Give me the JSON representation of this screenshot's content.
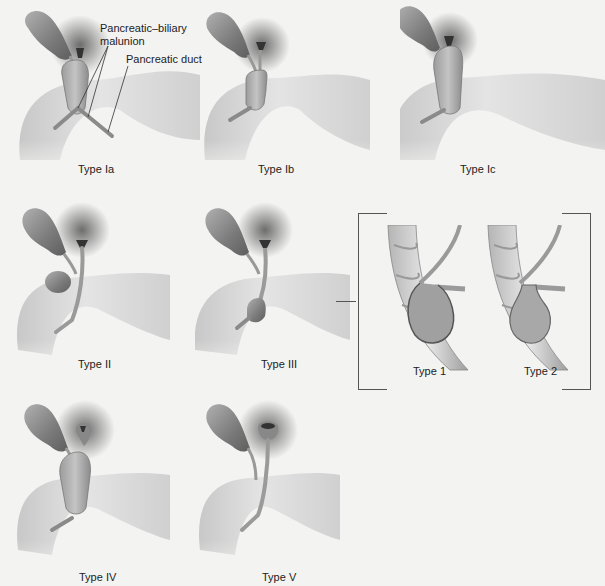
{
  "figure": {
    "background": "#f3f3f2",
    "colors": {
      "gallbladder": "#8a8a8a",
      "duct": "#9a9a9a",
      "duodenum": "#d9d9d9",
      "shadow": "#3a3a3a"
    }
  },
  "annotations": {
    "malunion": "Pancreatic–biliary\nmalunion",
    "malunion_line1": "Pancreatic–biliary",
    "malunion_line2": "malunion",
    "pancreatic_duct": "Pancreatic duct"
  },
  "panels": [
    {
      "id": "Ia",
      "caption": "Type Ia"
    },
    {
      "id": "Ib",
      "caption": "Type Ib"
    },
    {
      "id": "Ic",
      "caption": "Type Ic"
    },
    {
      "id": "II",
      "caption": "Type II"
    },
    {
      "id": "III",
      "caption": "Type III"
    },
    {
      "id": "IV",
      "caption": "Type IV"
    },
    {
      "id": "V",
      "caption": "Type V"
    }
  ],
  "subtypes": [
    {
      "id": "1",
      "caption": "Type 1"
    },
    {
      "id": "2",
      "caption": "Type 2"
    }
  ]
}
